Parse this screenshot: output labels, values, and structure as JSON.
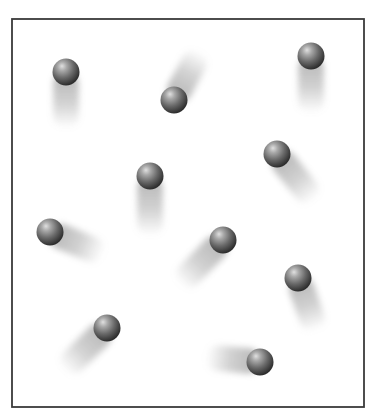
{
  "figure": {
    "frame": {
      "x": 12,
      "y": 19,
      "width": 352,
      "height": 388,
      "stroke": "#3a3a3a",
      "stroke_width": 1.8
    },
    "background": "#ffffff",
    "ball": {
      "radius": 13.5,
      "highlight_color": "#d8d8d8",
      "mid_color": "#7a7a7a",
      "edge_color": "#2e2e2e",
      "trail_color": "#9a9a9a"
    },
    "molecules": [
      {
        "id": 1,
        "cx": 66,
        "cy": 72,
        "trail_end": [
          66,
          128
        ]
      },
      {
        "id": 2,
        "cx": 174,
        "cy": 100,
        "trail_end": [
          200,
          52
        ]
      },
      {
        "id": 3,
        "cx": 311,
        "cy": 56,
        "trail_end": [
          311,
          113
        ]
      },
      {
        "id": 4,
        "cx": 150,
        "cy": 176,
        "trail_end": [
          150,
          236
        ]
      },
      {
        "id": 5,
        "cx": 277,
        "cy": 154,
        "trail_end": [
          314,
          200
        ]
      },
      {
        "id": 6,
        "cx": 50,
        "cy": 232,
        "trail_end": [
          103,
          254
        ]
      },
      {
        "id": 7,
        "cx": 223,
        "cy": 240,
        "trail_end": [
          180,
          284
        ]
      },
      {
        "id": 8,
        "cx": 298,
        "cy": 278,
        "trail_end": [
          316,
          330
        ]
      },
      {
        "id": 9,
        "cx": 107,
        "cy": 328,
        "trail_end": [
          64,
          370
        ]
      },
      {
        "id": 10,
        "cx": 260,
        "cy": 362,
        "trail_end": [
          206,
          357
        ]
      }
    ]
  }
}
